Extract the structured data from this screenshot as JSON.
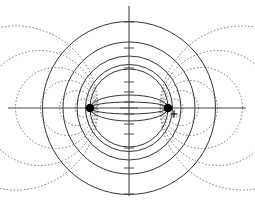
{
  "figure": {
    "width": 255,
    "height": 206,
    "background_color": "#ffffff"
  },
  "colors": {
    "axis": "#4a4a4a",
    "field_line": "#2b2b2b",
    "equipotential_line": "#6d6d6d",
    "charge": "#000000"
  },
  "axes": {
    "origin": {
      "x": 129,
      "y": 108
    },
    "x_axis": {
      "label": "x-axis",
      "x1": 8,
      "y1": 108,
      "x2": 246,
      "y2": 108
    },
    "y_axis": {
      "label": "y-axis",
      "x1": 129,
      "y1": 6,
      "x2": 129,
      "y2": 196
    },
    "origin_tick": {
      "x1": 120,
      "y1": 108,
      "x2": 138,
      "y2": 108
    },
    "y_ticks": [
      -86,
      -60,
      -40,
      -26,
      -16,
      -6,
      6,
      16,
      26,
      40,
      60,
      86
    ],
    "tick_half_width": 5
  },
  "charges": [
    {
      "name": "charge-left",
      "sign": "",
      "x": 90,
      "y": 108,
      "radius": 4.2,
      "show_plus": false
    },
    {
      "name": "charge-right",
      "sign": "+",
      "x": 168,
      "y": 108,
      "radius": 4.2,
      "show_plus": true
    }
  ],
  "chart_data": {
    "type": "scatter",
    "xlabel": "x",
    "ylabel": "y",
    "grid": false,
    "legend": null,
    "xlim": [
      -129,
      126
    ],
    "ylim": [
      -98,
      102
    ],
    "focus_separation": 78,
    "series": [
      {
        "name": "field-lines",
        "style": "solid",
        "description": "Coaxial circles through both charges; centered on the vertical axis",
        "circles": [
          {
            "cx": 129,
            "cy": 108,
            "r": 39.0
          },
          {
            "cx": 129,
            "cy": 108,
            "r": 43.5
          },
          {
            "cx": 129,
            "cy": 108,
            "r": 52.0
          },
          {
            "cx": 129,
            "cy": 108,
            "r": 66.0
          },
          {
            "cx": 129,
            "cy": 108,
            "r": 86.5
          }
        ]
      },
      {
        "name": "equipotentials-left",
        "style": "dotted",
        "description": "Apollonius circles enclosing the left charge",
        "circles": [
          {
            "cx": 84,
            "cy": 108,
            "r": 9.0
          },
          {
            "cx": 77,
            "cy": 108,
            "r": 17.5
          },
          {
            "cx": 68,
            "cy": 108,
            "r": 27.5
          },
          {
            "cx": 56,
            "cy": 108,
            "r": 40.5
          },
          {
            "cx": 40,
            "cy": 108,
            "r": 57.5
          },
          {
            "cx": 16,
            "cy": 108,
            "r": 82.0
          }
        ]
      },
      {
        "name": "equipotentials-right",
        "style": "dotted",
        "description": "Apollonius circles enclosing the right charge",
        "circles": [
          {
            "cx": 174,
            "cy": 108,
            "r": 9.0
          },
          {
            "cx": 181,
            "cy": 108,
            "r": 17.5
          },
          {
            "cx": 190,
            "cy": 108,
            "r": 27.5
          },
          {
            "cx": 202,
            "cy": 108,
            "r": 40.5
          },
          {
            "cx": 218,
            "cy": 108,
            "r": 57.5
          },
          {
            "cx": 242,
            "cy": 108,
            "r": 82.0
          }
        ]
      },
      {
        "name": "inner-field-ellipse",
        "style": "solid",
        "description": "Small lens-shaped arcs connecting the two charges near the axis",
        "arcs": [
          {
            "from_x": 90,
            "from_y": 108,
            "to_x": 168,
            "to_y": 108,
            "rx": 39,
            "ry": 13,
            "sweep": 1
          },
          {
            "from_x": 90,
            "from_y": 108,
            "to_x": 168,
            "to_y": 108,
            "rx": 39,
            "ry": 13,
            "sweep": 0
          },
          {
            "from_x": 90,
            "from_y": 108,
            "to_x": 168,
            "to_y": 108,
            "rx": 39,
            "ry": 6,
            "sweep": 1
          },
          {
            "from_x": 90,
            "from_y": 108,
            "to_x": 168,
            "to_y": 108,
            "rx": 39,
            "ry": 6,
            "sweep": 0
          }
        ]
      }
    ]
  }
}
